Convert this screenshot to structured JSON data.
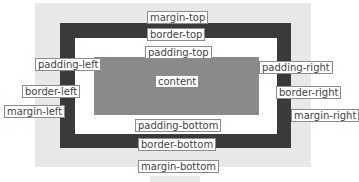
{
  "diagram": {
    "colors": {
      "margin": "#e8e8e8",
      "border": "#3a3a3a",
      "padding": "#ffffff",
      "content": "#8a8a8a"
    },
    "labels": {
      "margin_top": "margin-top",
      "border_top": "border-top",
      "padding_top": "padding-top",
      "padding_left": "padding-left",
      "content": "content",
      "padding_right": "padding-right",
      "border_left": "border-left",
      "border_right": "border-right",
      "margin_left": "margin-left",
      "margin_right": "margin-right",
      "padding_bottom": "padding-bottom",
      "border_bottom": "border-bottom",
      "margin_bottom": "margin-bottom"
    }
  }
}
